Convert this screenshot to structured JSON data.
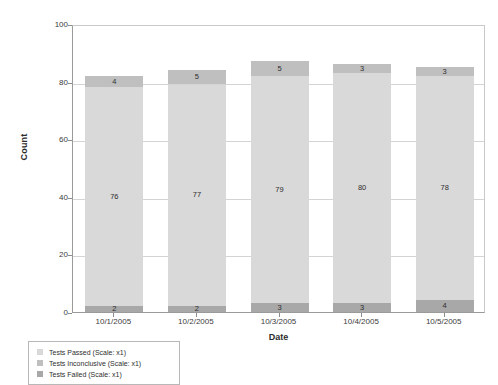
{
  "chart_data": {
    "type": "bar",
    "stacked": true,
    "title": "",
    "xlabel": "Date",
    "ylabel": "Count",
    "categories": [
      "10/1/2005",
      "10/2/2005",
      "10/3/2005",
      "10/4/2005",
      "10/5/2005"
    ],
    "series": [
      {
        "name": "Tests Failed",
        "values": [
          2,
          2,
          3,
          3,
          4
        ],
        "color": "#a8a8a8",
        "stack_order": 0
      },
      {
        "name": "Tests Passed",
        "values": [
          76,
          77,
          79,
          80,
          78
        ],
        "color": "#d9d9d9",
        "stack_order": 1
      },
      {
        "name": "Tests Inconclusive",
        "values": [
          4,
          5,
          5,
          3,
          3
        ],
        "color": "#bfbfbf",
        "stack_order": 2
      }
    ],
    "totals": [
      82,
      84,
      87,
      86,
      85
    ],
    "ylim": [
      0,
      100
    ],
    "yticks": [
      0,
      20,
      40,
      60,
      80,
      100
    ],
    "ytick_labels": [
      "0",
      "20",
      "40",
      "60",
      "80",
      "100"
    ],
    "grid": true,
    "legend_position": "below-left",
    "legend_entries": [
      "Tests Passed (Scale: x1)",
      "Tests Inconclusive (Scale: x1)",
      "Tests Failed (Scale: x1)"
    ]
  },
  "legend": {
    "items": [
      {
        "label": "Tests Passed (Scale: x1)",
        "color": "#d9d9d9"
      },
      {
        "label": "Tests Inconclusive (Scale: x1)",
        "color": "#bfbfbf"
      },
      {
        "label": "Tests Failed (Scale: x1)",
        "color": "#a8a8a8"
      }
    ]
  },
  "axes": {
    "y_title": "Count",
    "x_title": "Date"
  }
}
